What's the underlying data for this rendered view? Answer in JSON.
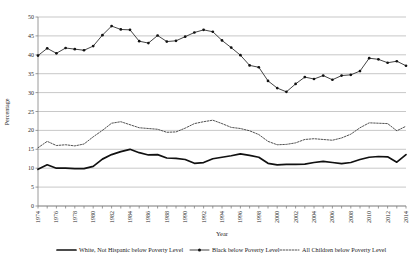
{
  "chart_data": {
    "type": "line",
    "title": "",
    "xlabel": "Year",
    "ylabel": "Percentage",
    "ylim": [
      0,
      50
    ],
    "ytick_step": 5,
    "grid": true,
    "legend_position": "bottom",
    "yticks": [
      "0",
      "5",
      "10",
      "15",
      "20",
      "25",
      "30",
      "35",
      "40",
      "45",
      "50"
    ],
    "x": [
      1974,
      1975,
      1976,
      1977,
      1978,
      1979,
      1980,
      1981,
      1982,
      1983,
      1984,
      1985,
      1986,
      1987,
      1988,
      1989,
      1990,
      1991,
      1992,
      1993,
      1994,
      1995,
      1996,
      1997,
      1998,
      1999,
      2000,
      2001,
      2002,
      2003,
      2004,
      2005,
      2006,
      2007,
      2008,
      2009,
      2010,
      2011,
      2012,
      2013,
      2014
    ],
    "xtick_labels": [
      "1974",
      "1976",
      "1978",
      "1980",
      "1982",
      "1984",
      "1986",
      "1988",
      "1990",
      "1992",
      "1994",
      "1996",
      "1998",
      "2000",
      "2002",
      "2004",
      "2006",
      "2008",
      "2010",
      "2012",
      "2014"
    ],
    "series": [
      {
        "name": "White, Not Hispanic below Poverty Level",
        "style": "solid-thick",
        "markers": false,
        "values": [
          9.7,
          10.9,
          10.0,
          10.0,
          9.9,
          9.9,
          10.5,
          12.4,
          13.6,
          14.4,
          15.0,
          14.1,
          13.5,
          13.6,
          12.7,
          12.6,
          12.3,
          11.3,
          11.5,
          12.5,
          12.9,
          13.3,
          13.8,
          13.4,
          12.9,
          11.3,
          10.9,
          11.0,
          11.0,
          11.1,
          11.5,
          11.8,
          11.5,
          11.2,
          11.5,
          12.3,
          12.9,
          13.1,
          13.0,
          11.6,
          13.6
        ]
      },
      {
        "name": "Black below Poverty Level",
        "style": "solid-thin-markers",
        "markers": true,
        "values": [
          39.8,
          41.7,
          40.4,
          41.8,
          41.5,
          41.2,
          42.3,
          45.2,
          47.6,
          46.7,
          46.6,
          43.6,
          43.1,
          45.1,
          43.5,
          43.7,
          44.8,
          45.9,
          46.6,
          46.1,
          43.8,
          41.9,
          39.9,
          37.2,
          36.7,
          33.1,
          31.2,
          30.2,
          32.3,
          34.1,
          33.6,
          34.5,
          33.4,
          34.5,
          34.7,
          35.7,
          39.1,
          38.8,
          37.9,
          38.3,
          37.1
        ]
      },
      {
        "name": "All Children below Poverty Level",
        "style": "dotted",
        "markers": false,
        "values": [
          15.4,
          17.1,
          16.0,
          16.2,
          15.9,
          16.4,
          18.3,
          20.0,
          21.9,
          22.3,
          21.5,
          20.7,
          20.5,
          20.3,
          19.5,
          19.6,
          20.6,
          21.8,
          22.3,
          22.7,
          21.8,
          20.8,
          20.5,
          19.9,
          18.9,
          17.1,
          16.2,
          16.3,
          16.7,
          17.6,
          17.8,
          17.6,
          17.4,
          18.0,
          19.0,
          20.7,
          22.0,
          21.9,
          21.8,
          19.9,
          21.1
        ]
      }
    ],
    "legend": [
      {
        "label": "White, Not Hispanic below Poverty Level",
        "marker": "line-thick"
      },
      {
        "label": "Black below Poverty Level",
        "marker": "line-dot-marker"
      },
      {
        "label": "All Children below Poverty Level",
        "marker": "line-dotted"
      }
    ]
  }
}
